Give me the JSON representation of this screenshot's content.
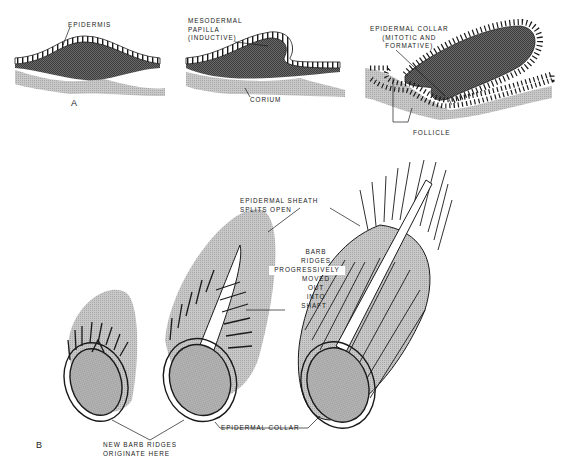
{
  "figure": {
    "panel_a": {
      "letter": "A",
      "labels": {
        "epidermis": "EPIDERMIS",
        "mesodermal_papilla": "MESODERMAL\nPAPILLA\n(INDUCTIVE)",
        "corium": "CORIUM",
        "epidermal_collar": "EPIDERMAL COLLAR\n(MITOTIC AND\nFORMATIVE)",
        "follicle": "FOLLICLE"
      }
    },
    "panel_b": {
      "letter": "B",
      "labels": {
        "sheath_splits": "EPIDERMAL SHEATH\nSPLITS OPEN",
        "barb_ridges_1": "BARB",
        "barb_ridges_2": "RIDGES",
        "barb_ridges_3": "PROGRESSIVELY",
        "barb_ridges_4": "MOVED",
        "barb_ridges_5": "OUT",
        "barb_ridges_6": "INTO",
        "barb_ridges_7": "SHAFT",
        "epidermal_collar": "EPIDERMAL COLLAR",
        "new_barb_ridges": "NEW BARB RIDGES\nORIGINATE HERE"
      }
    },
    "colors": {
      "ink": "#1a1a1a",
      "dark_tissue": "#5a5a5a",
      "light_tissue": "#b8b8b8",
      "sheath_gray": "#c4c4c4",
      "pulp_gray": "#a6a6a6"
    }
  }
}
